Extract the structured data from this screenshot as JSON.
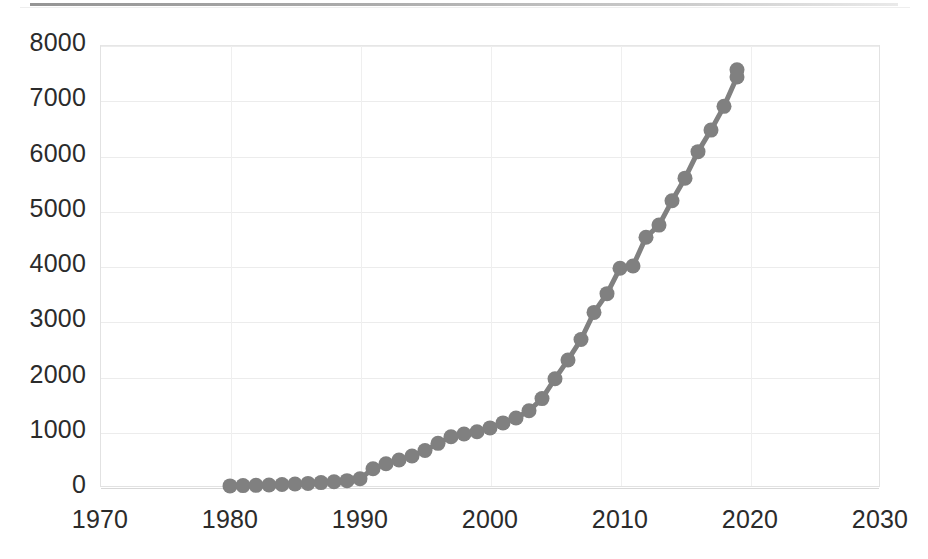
{
  "chart_data": {
    "type": "line",
    "title": "",
    "subtitle": "",
    "xlabel": "",
    "ylabel": "",
    "xlim": [
      1970,
      2030
    ],
    "ylim": [
      0,
      8000
    ],
    "grid": true,
    "legend": false,
    "legend_position": "none",
    "marker": "circle",
    "series_color": "#808080",
    "x_ticks": [
      "1970",
      "1980",
      "1990",
      "2000",
      "2010",
      "2020",
      "2030"
    ],
    "x_tick_values": [
      1970,
      1980,
      1990,
      2000,
      2010,
      2020,
      2030
    ],
    "y_ticks": [
      "0",
      "1000",
      "2000",
      "3000",
      "4000",
      "5000",
      "6000",
      "7000",
      "8000"
    ],
    "y_tick_values": [
      0,
      1000,
      2000,
      3000,
      4000,
      5000,
      6000,
      7000,
      8000
    ],
    "series": [
      {
        "name": "",
        "x": [
          1980,
          1981,
          1982,
          1983,
          1984,
          1985,
          1986,
          1987,
          1988,
          1989,
          1990,
          1991,
          1992,
          1993,
          1994,
          1995,
          1996,
          1997,
          1998,
          1999,
          2000,
          2001,
          2002,
          2003,
          2004,
          2005,
          2006,
          2007,
          2008,
          2009,
          2010,
          2011,
          2012,
          2013,
          2014,
          2015,
          2016,
          2017,
          2018,
          2019
        ],
        "values": [
          20,
          25,
          30,
          35,
          45,
          55,
          65,
          80,
          95,
          115,
          150,
          330,
          420,
          490,
          560,
          660,
          790,
          910,
          960,
          1000,
          1070,
          1160,
          1250,
          1380,
          1600,
          1960,
          2300,
          2670,
          3160,
          3500,
          3960,
          4000,
          4520,
          4740,
          5180,
          5590,
          6070,
          6460,
          6890,
          7420
        ]
      },
      {
        "name": "tail",
        "x": [
          2019
        ],
        "values": [
          7550
        ]
      }
    ]
  },
  "figure": {
    "background_color": "#ffffff",
    "plot_background_color": "#ffffff",
    "grid_color": "#ececec",
    "frame_color": "#e2e2e2",
    "tick_label_color": "#2b2b2b",
    "scan_artifact": true
  }
}
